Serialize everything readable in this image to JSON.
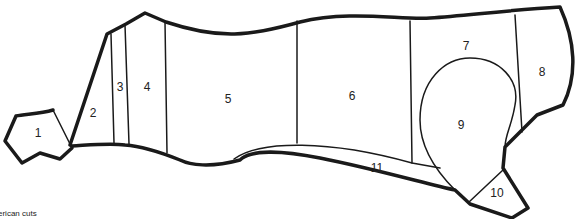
{
  "diagram": {
    "caption": "erican cuts",
    "line_color": "#1a1a1a",
    "background": "#ffffff",
    "cuts": [
      {
        "id": "1",
        "label": "1",
        "x": 38,
        "y": 133
      },
      {
        "id": "2",
        "label": "2",
        "x": 93,
        "y": 113
      },
      {
        "id": "3",
        "label": "3",
        "x": 120,
        "y": 87
      },
      {
        "id": "4",
        "label": "4",
        "x": 147,
        "y": 87
      },
      {
        "id": "5",
        "label": "5",
        "x": 228,
        "y": 99
      },
      {
        "id": "6",
        "label": "6",
        "x": 352,
        "y": 96
      },
      {
        "id": "7",
        "label": "7",
        "x": 466,
        "y": 46
      },
      {
        "id": "8",
        "label": "8",
        "x": 542,
        "y": 72
      },
      {
        "id": "9",
        "label": "9",
        "x": 461,
        "y": 125
      },
      {
        "id": "10",
        "label": "10",
        "x": 497,
        "y": 193
      },
      {
        "id": "11",
        "label": "11",
        "x": 377,
        "y": 168
      }
    ]
  }
}
